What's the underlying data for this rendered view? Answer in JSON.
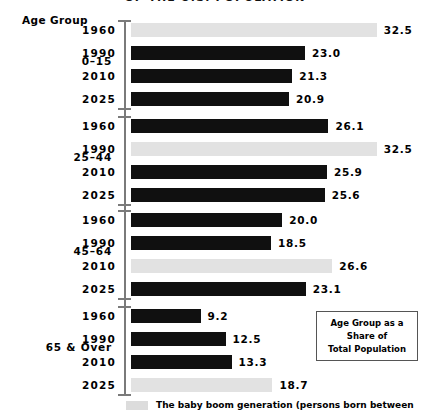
{
  "title": "OF THE U.S. POPULATION",
  "axis_header": "Age Group",
  "legend_box": {
    "line1": "Age Group as a",
    "line2": "Share of",
    "line3": "Total Population"
  },
  "footnote": {
    "swatch": "baby-boom-swatch",
    "text": "The baby boom generation (persons born between"
  },
  "colors": {
    "bar": "#101010",
    "baby_boom_bar": "#e2e2e2",
    "axis": "#7a7a7a",
    "background": "#ffffff"
  },
  "chart_data": {
    "type": "bar",
    "title": "OF THE U.S. POPULATION",
    "xlabel": "",
    "ylabel": "Age Group",
    "xlim": [
      0,
      32.5
    ],
    "grid": false,
    "orientation": "horizontal",
    "legend": {
      "position": "bottom",
      "entries": [
        {
          "name": "Baby boom generation",
          "color": "#e2e2e2"
        },
        {
          "name": "Other cohorts",
          "color": "#101010"
        }
      ]
    },
    "groups": [
      {
        "label": "0–15",
        "rows": [
          {
            "year": "1960",
            "value": 32.5,
            "value_label": "32.5",
            "baby_boom": true
          },
          {
            "year": "1990",
            "value": 23.0,
            "value_label": "23.0",
            "baby_boom": false
          },
          {
            "year": "2010",
            "value": 21.3,
            "value_label": "21.3",
            "baby_boom": false
          },
          {
            "year": "2025",
            "value": 20.9,
            "value_label": "20.9",
            "baby_boom": false
          }
        ]
      },
      {
        "label": "25–44",
        "rows": [
          {
            "year": "1960",
            "value": 26.1,
            "value_label": "26.1",
            "baby_boom": false
          },
          {
            "year": "1990",
            "value": 32.5,
            "value_label": "32.5",
            "baby_boom": true
          },
          {
            "year": "2010",
            "value": 25.9,
            "value_label": "25.9",
            "baby_boom": false
          },
          {
            "year": "2025",
            "value": 25.6,
            "value_label": "25.6",
            "baby_boom": false
          }
        ]
      },
      {
        "label": "45–64",
        "rows": [
          {
            "year": "1960",
            "value": 20.0,
            "value_label": "20.0",
            "baby_boom": false
          },
          {
            "year": "1990",
            "value": 18.5,
            "value_label": "18.5",
            "baby_boom": false
          },
          {
            "year": "2010",
            "value": 26.6,
            "value_label": "26.6",
            "baby_boom": true
          },
          {
            "year": "2025",
            "value": 23.1,
            "value_label": "23.1",
            "baby_boom": false
          }
        ]
      },
      {
        "label": "65 & Over",
        "rows": [
          {
            "year": "1960",
            "value": 9.2,
            "value_label": "9.2",
            "baby_boom": false
          },
          {
            "year": "1990",
            "value": 12.5,
            "value_label": "12.5",
            "baby_boom": false
          },
          {
            "year": "2010",
            "value": 13.3,
            "value_label": "13.3",
            "baby_boom": false
          },
          {
            "year": "2025",
            "value": 18.7,
            "value_label": "18.7",
            "baby_boom": true
          }
        ]
      }
    ]
  },
  "layout": {
    "bar_origin_x": 131,
    "px_per_unit": 7.565,
    "group_tops": [
      22,
      118,
      212,
      308
    ],
    "row_pitch": 23,
    "axis_top": 20,
    "axis_bottom": 394
  }
}
